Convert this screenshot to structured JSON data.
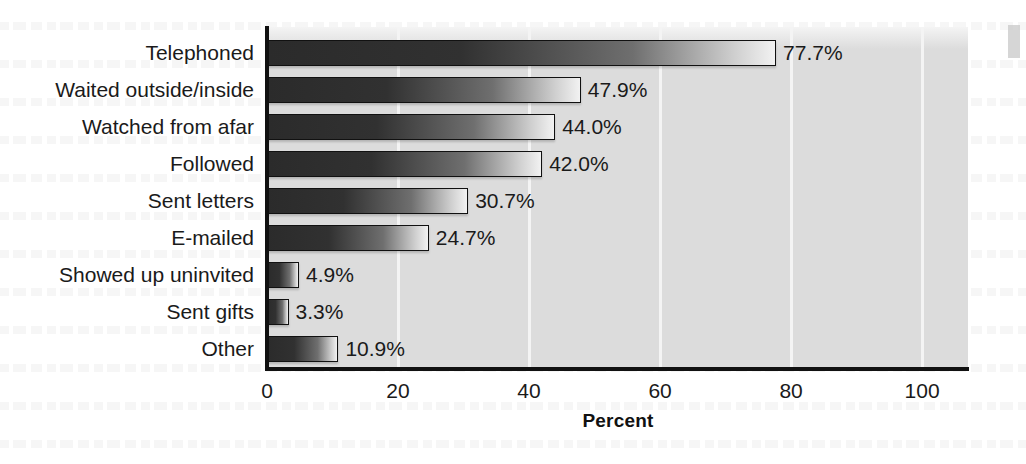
{
  "chart_data": {
    "type": "bar",
    "orientation": "horizontal",
    "title": "",
    "xlabel": "Percent",
    "ylabel": "",
    "xlim": [
      0,
      107
    ],
    "xticks": [
      0,
      20,
      40,
      60,
      80,
      100
    ],
    "xtick_labels": [
      "0",
      "20",
      "40",
      "60",
      "80",
      "100"
    ],
    "grid": "vertical-white-gridlines",
    "legend": "none",
    "categories": [
      "Telephoned",
      "Waited outside/inside",
      "Watched from afar",
      "Followed",
      "Sent letters",
      "E-mailed",
      "Showed up uninvited",
      "Sent gifts",
      "Other"
    ],
    "values": [
      77.7,
      47.9,
      44.0,
      42.0,
      30.7,
      24.7,
      4.9,
      3.3,
      10.9
    ],
    "value_labels": [
      "77.7%",
      "47.9%",
      "44.0%",
      "42.0%",
      "30.7%",
      "24.7%",
      "4.9%",
      "3.3%",
      "10.9%"
    ],
    "bar_fill": "gradient dark-gray to white, left to right",
    "bar_outline_color": "#111111",
    "plot_background_color": "#dcdcdc",
    "gridline_color": "#f4f4f4",
    "page_background_color": "#ffffff",
    "text_color": "#1a1a1a"
  },
  "axis": {
    "x_title": "Percent"
  }
}
